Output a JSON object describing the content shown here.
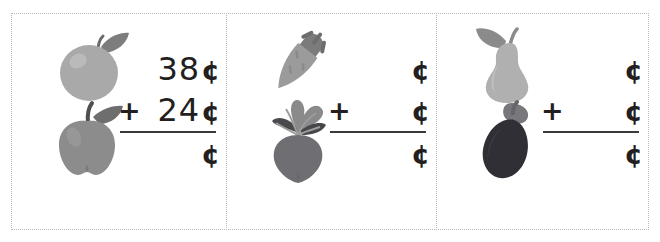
{
  "worksheet": {
    "title": "Adding money amounts worksheet",
    "background_color": "#ffffff",
    "border_color": "#b9b9bd",
    "ink_color": "#231f20"
  },
  "symbols": {
    "plus": "+",
    "cent": "¢",
    "blank": ""
  },
  "problems": [
    {
      "id": "problem-1",
      "items": [
        {
          "name": "orange",
          "label": "orange",
          "color": "#a9a9a9"
        },
        {
          "name": "apple",
          "label": "apple",
          "color": "#8c8c8c"
        }
      ],
      "addend_1": "38",
      "addend_1_unit": "¢",
      "operator": "+",
      "addend_2": "24",
      "addend_2_unit": "¢",
      "sum": "",
      "sum_unit": "¢"
    },
    {
      "id": "problem-2",
      "items": [
        {
          "name": "carrot",
          "label": "carrot",
          "color": "#9b9b9b"
        },
        {
          "name": "beet",
          "label": "beet",
          "color": "#6f6f73"
        }
      ],
      "addend_1": "",
      "addend_1_unit": "¢",
      "operator": "+",
      "addend_2": "",
      "addend_2_unit": "¢",
      "sum": "",
      "sum_unit": "¢"
    },
    {
      "id": "problem-3",
      "items": [
        {
          "name": "pear",
          "label": "pear",
          "color": "#b0b0b0"
        },
        {
          "name": "eggplant",
          "label": "eggplant",
          "color": "#2f2f35"
        }
      ],
      "addend_1": "",
      "addend_1_unit": "¢",
      "operator": "+",
      "addend_2": "",
      "addend_2_unit": "¢",
      "sum": "",
      "sum_unit": "¢"
    }
  ]
}
